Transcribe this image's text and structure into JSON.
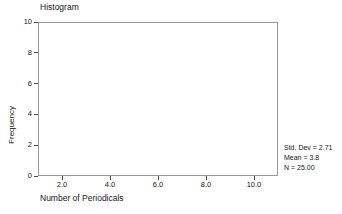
{
  "chart_data": {
    "type": "bar",
    "title": "Histogram",
    "subtitle": "",
    "xlabel": "Number of Periodicals",
    "ylabel": "Frequency",
    "xlim": [
      1,
      11
    ],
    "ylim": [
      0,
      10
    ],
    "xticks": [
      2.0,
      4.0,
      6.0,
      8.0,
      10.0
    ],
    "xtick_labels": [
      "2.0",
      "4.0",
      "6.0",
      "8.0",
      "10.0"
    ],
    "yticks": [
      0,
      2,
      4,
      6,
      8,
      10
    ],
    "ytick_labels": [
      "0",
      "2",
      "4",
      "6",
      "8",
      "10"
    ],
    "grid": false,
    "legend": null,
    "categories": [],
    "values": [],
    "bars": [],
    "annotations": [
      "Std. Dev = 2.71",
      "Mean = 3.8",
      "N = 25.00"
    ],
    "statistics": {
      "std_dev_label": "Std. Dev = 2.71",
      "mean_label": "Mean = 3.8",
      "n_label": "N = 25.00",
      "std_dev": 2.71,
      "mean": 3.8,
      "n": 25.0
    },
    "colors": {
      "frame": "#9a9a9a",
      "tick": "#4a4a4a",
      "text": "#161616",
      "background": "#ffffff",
      "bar_fill": "#808080"
    }
  }
}
